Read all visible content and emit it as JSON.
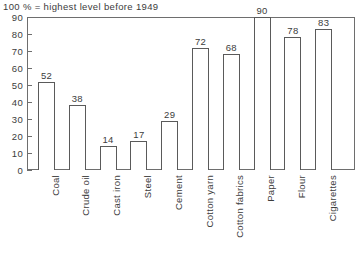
{
  "chart_data": {
    "type": "bar",
    "title": "100 % = highest level before 1949",
    "xlabel": "",
    "ylabel": "",
    "ylim": [
      0,
      90
    ],
    "ytick_values": [
      0,
      10,
      20,
      30,
      40,
      50,
      60,
      70,
      80,
      90
    ],
    "ytick_labels": [
      "0",
      "10",
      "20",
      "30",
      "40",
      "50",
      "60",
      "70",
      "80",
      "90"
    ],
    "grid": false,
    "legend": "none",
    "categories": [
      "Coal",
      "Crude oil",
      "Cast iron",
      "Steel",
      "Cement",
      "Cotton yarn",
      "Cotton fabrics",
      "Paper",
      "Flour",
      "Cigarettes"
    ],
    "values": [
      52,
      38,
      14,
      17,
      29,
      72,
      68,
      90,
      78,
      83
    ],
    "value_labels": [
      "52",
      "38",
      "14",
      "17",
      "29",
      "72",
      "68",
      "90",
      "78",
      "83"
    ],
    "colors": {
      "bar_fill": "#ffffff",
      "bar_edge": "#5a5a5a",
      "axis": "#6e6e6e",
      "text": "#3c3c3c",
      "background": "#ffffff"
    }
  }
}
